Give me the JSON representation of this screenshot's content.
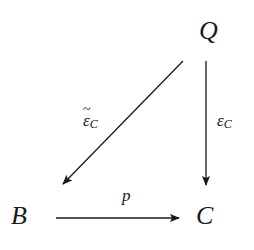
{
  "diagram": {
    "type": "commutative-diagram",
    "nodes": {
      "Q": {
        "label": "Q",
        "x": 200,
        "y": 19
      },
      "B": {
        "label": "B",
        "x": 11,
        "y": 204
      },
      "C": {
        "label": "C",
        "x": 196,
        "y": 204
      }
    },
    "arrows": [
      {
        "id": "eps-tilde",
        "from": "Q",
        "to": "B",
        "label_base": "ε",
        "label_sub": "C",
        "label_accent": "~",
        "style": "solid"
      },
      {
        "id": "eps",
        "from": "Q",
        "to": "C",
        "label_base": "ε",
        "label_sub": "C",
        "style": "solid"
      },
      {
        "id": "p",
        "from": "B",
        "to": "C",
        "label": "p",
        "style": "solid"
      }
    ],
    "colors": {
      "ink": "#1a1a1a",
      "background": "#ffffff"
    }
  }
}
